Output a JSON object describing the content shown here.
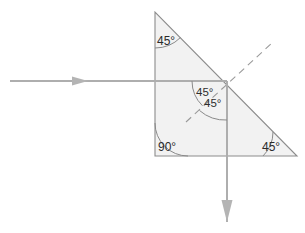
{
  "figure": {
    "background_color": "#ffffff",
    "prism": {
      "name": "right-isosceles-prism",
      "fill_color": "#f2f2f2",
      "stroke_color": "#8c8c8c",
      "vertices": {
        "top_apex": [
          155,
          12
        ],
        "bottom_left": [
          155,
          156
        ],
        "bottom_right": [
          297,
          156
        ]
      },
      "angles": {
        "top": "45°",
        "bottom_left": "90°",
        "bottom_right": "45°"
      }
    },
    "labels": {
      "top_angle": "45°",
      "right_angle_corner": "90°",
      "bottom_right_angle": "45°",
      "incidence_angle": "45°",
      "refraction_angle": "45°"
    },
    "rays": {
      "incident": {
        "name": "incident-ray",
        "direction": "horizontal-right",
        "start": [
          10,
          81
        ],
        "end": [
          227,
          81
        ],
        "arrow_at": [
          85,
          81
        ],
        "color": "#aeaeae"
      },
      "transmitted": {
        "name": "transmitted-ray",
        "direction": "vertical-down",
        "start": [
          227,
          81
        ],
        "end": [
          227,
          222
        ],
        "arrow_at": [
          227,
          222
        ],
        "color": "#aeaeae"
      }
    },
    "normal": {
      "name": "surface-normal",
      "style": "dashed",
      "start": [
        186,
        122
      ],
      "end": [
        272,
        43
      ],
      "color": "#9a9a9a"
    },
    "interface_point": [
      227,
      81
    ]
  }
}
